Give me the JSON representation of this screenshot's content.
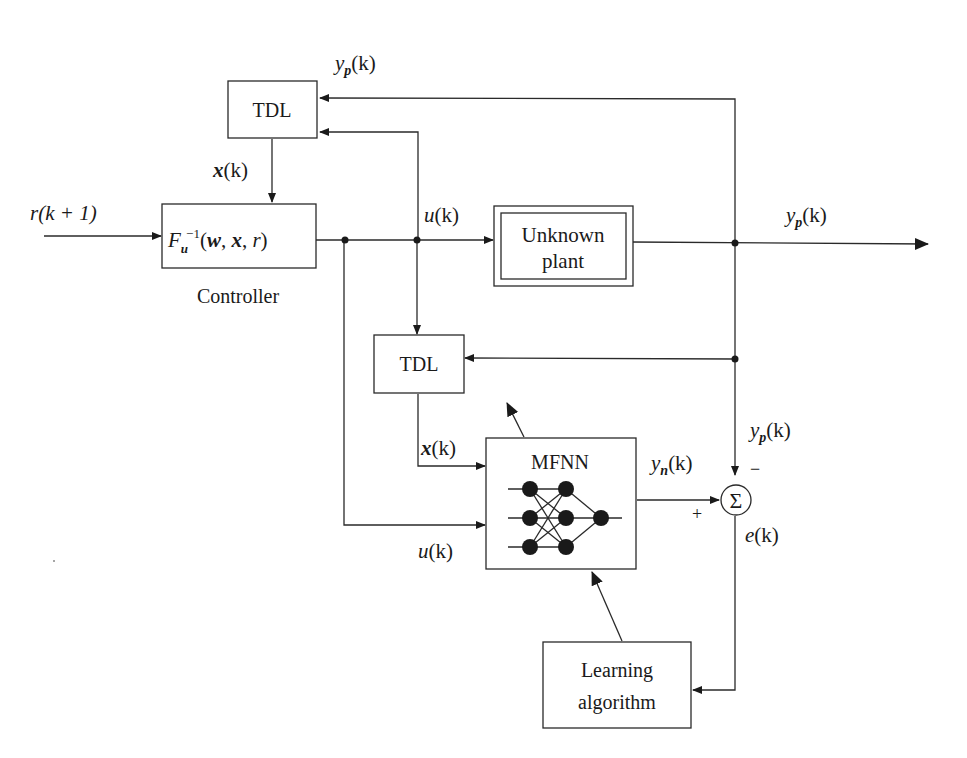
{
  "diagram": {
    "type": "block-diagram",
    "blocks": {
      "tdl_top": {
        "label": "TDL"
      },
      "controller": {
        "label_main": "F",
        "label_sub": "u",
        "label_sup": "−1",
        "label_args_w": "w",
        "label_args_x": "x",
        "label_args_r": "r",
        "caption": "Controller"
      },
      "plant": {
        "line1": "Unknown",
        "line2": "plant"
      },
      "tdl_mid": {
        "label": "TDL"
      },
      "mfnn": {
        "label": "MFNN"
      },
      "learning": {
        "line1": "Learning",
        "line2": "algorithm"
      },
      "summer": {
        "symbol": "Σ",
        "plus": "+",
        "minus": "−"
      }
    },
    "signals": {
      "r_input": "r(k + 1)",
      "yp_top": "yp(k)",
      "x_top": "x(k)",
      "u_top": "u(k)",
      "yp_output": "yp(k)",
      "yp_right": "yp(k)",
      "x_mid": "x(k)",
      "yn": "yn(k)",
      "u_bottom": "u(k)",
      "e": "e(k)"
    },
    "signal_parts": {
      "y": "y",
      "p": "p",
      "n": "n",
      "k": "(k)",
      "x": "x",
      "u": "u",
      "e": "e",
      "r": "r(k + 1)"
    }
  }
}
